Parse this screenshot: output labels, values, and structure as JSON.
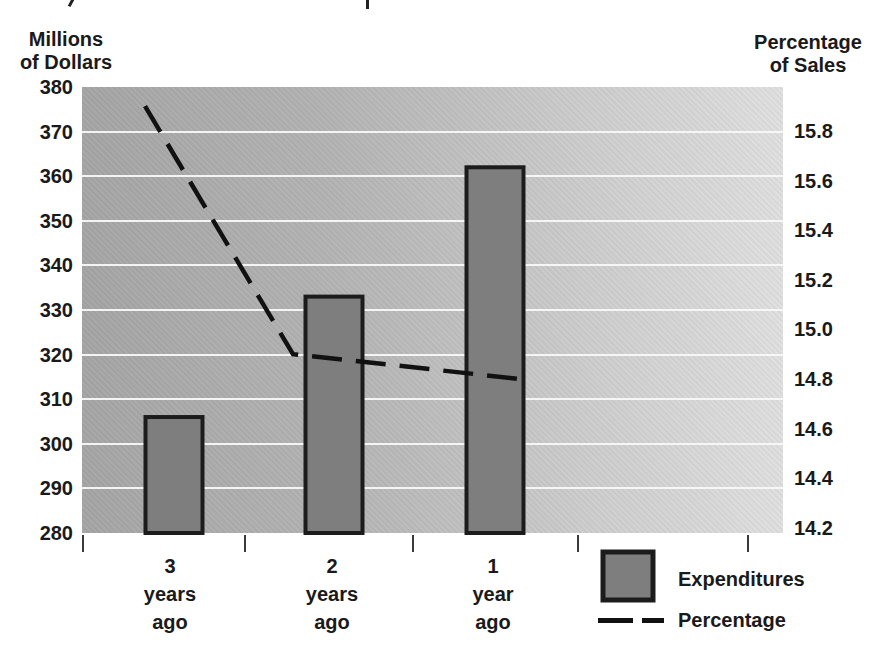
{
  "chart_data": {
    "type": "combo-bar-line",
    "categories": [
      "3 years ago",
      "2 years ago",
      "1 year ago"
    ],
    "series": [
      {
        "name": "Expenditures",
        "type": "bar",
        "axis": "left",
        "values": [
          306,
          333,
          362
        ]
      },
      {
        "name": "Percentage",
        "type": "line",
        "style": "dashed",
        "axis": "right",
        "values": [
          15.9,
          14.9,
          14.8
        ]
      }
    ],
    "left_axis": {
      "title_lines": [
        "Millions",
        "of Dollars"
      ],
      "ticks": [
        "380",
        "370",
        "360",
        "350",
        "340",
        "330",
        "320",
        "310",
        "300",
        "290",
        "280"
      ],
      "range": [
        280,
        380
      ]
    },
    "right_axis": {
      "title_lines": [
        "Percentage",
        "of Sales"
      ],
      "ticks": [
        "15.8",
        "15.6",
        "15.4",
        "15.2",
        "15.0",
        "14.8",
        "14.6",
        "14.4",
        "14.2"
      ],
      "range": [
        14.2,
        15.8
      ]
    },
    "grid": "horizontal-white-lines",
    "legend": {
      "position": "bottom-right",
      "entries": [
        {
          "label": "Expenditures",
          "swatch": "bar"
        },
        {
          "label": "Percentage",
          "swatch": "dashed-line"
        }
      ]
    }
  },
  "colors": {
    "plot_bg_left": "#a6a6a6",
    "plot_bg_right": "#e0e0e0",
    "gridline": "#f8f8f8",
    "bar_fill": "#7e7e7e",
    "bar_border": "#1c1c1c",
    "line": "#111111",
    "text": "#1a1a1a"
  },
  "layout": {
    "plot": {
      "left": 82,
      "top": 87,
      "width": 701,
      "height": 446
    },
    "bar_centers": [
      92,
      252,
      413
    ],
    "bar_width": 57,
    "line_x": [
      63,
      211,
      438
    ],
    "xticks_abs": [
      83,
      245,
      413,
      578,
      748
    ],
    "category_centers_abs": [
      170,
      332,
      493
    ],
    "right_axis_anchor": {
      "value": 15.8,
      "y_abs": 131,
      "px_per_unit": 248
    }
  }
}
